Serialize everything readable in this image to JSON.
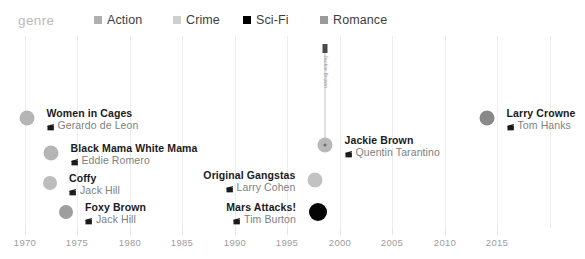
{
  "legend": {
    "title": "genre",
    "items": [
      {
        "label": "Action",
        "color": "#b0b0b0",
        "x": 94
      },
      {
        "label": "Crime",
        "color": "#cfcfcf",
        "x": 173
      },
      {
        "label": "Sci-Fi",
        "color": "#000000",
        "x": 243
      },
      {
        "label": "Romance",
        "color": "#9a9a9a",
        "x": 320
      }
    ]
  },
  "icons": {
    "film": "film-clapper-icon"
  },
  "chart_data": {
    "type": "scatter",
    "title": "",
    "xlabel": "",
    "ylabel": "",
    "xlim": [
      1968.5,
      2017.5
    ],
    "grid": true,
    "legend_position": "top",
    "axis_ticks": [
      1970,
      1975,
      1980,
      1985,
      1990,
      1995,
      2000,
      2005,
      2010,
      2015
    ],
    "categories": [
      "Action",
      "Crime",
      "Sci-Fi",
      "Romance"
    ],
    "points": [
      {
        "title": "Women in Cages",
        "director": "Gerardo de Leon",
        "year": 1971,
        "genre": "Action",
        "color": "#b5b5b5",
        "size": 15,
        "px": 27,
        "py": 82,
        "label_side": "left",
        "label_dx": 12,
        "label_dy": -11
      },
      {
        "title": "Black Mama White Mama",
        "director": "Eddie Romero",
        "year": 1973,
        "genre": "Action",
        "color": "#b5b5b5",
        "size": 15,
        "px": 51,
        "py": 117,
        "label_side": "left",
        "label_dx": 12,
        "label_dy": -11
      },
      {
        "title": "Coffy",
        "director": "Jack Hill",
        "year": 1973,
        "genre": "Action",
        "color": "#bdbdbd",
        "size": 14,
        "px": 50,
        "py": 147,
        "label_side": "left",
        "label_dx": 12,
        "label_dy": -11
      },
      {
        "title": "Foxy Brown",
        "director": "Jack Hill",
        "year": 1974,
        "genre": "Action",
        "color": "#9e9e9e",
        "size": 14,
        "px": 66,
        "py": 176,
        "label_side": "left",
        "label_dx": 12,
        "label_dy": -11
      },
      {
        "title": "Original Gangstas",
        "director": "Larry Cohen",
        "year": 1996,
        "genre": "Crime",
        "color": "#c2c2c2",
        "size": 15,
        "px": 315,
        "py": 144,
        "label_side": "right",
        "label_dx": -12,
        "label_dy": -11
      },
      {
        "title": "Mars Attacks!",
        "director": "Tim Burton",
        "year": 1996,
        "genre": "Sci-Fi",
        "color": "#050505",
        "size": 18,
        "px": 318,
        "py": 176,
        "label_side": "right",
        "label_dx": -13,
        "label_dy": -11
      },
      {
        "title": "Jackie Brown",
        "director": "Quentin Tarantino",
        "year": 1997,
        "genre": "Crime",
        "color": "#b8b8b8",
        "size": 15,
        "px": 325,
        "py": 109,
        "label_side": "left",
        "label_dx": 12,
        "label_dy": -11,
        "has_inner_dot": true,
        "stem": {
          "label": "Jackie Brown",
          "top": 8,
          "height": 96,
          "cap_height": 9
        }
      },
      {
        "title": "Larry Crowne",
        "director": "Tom Hanks",
        "year": 2011,
        "genre": "Romance",
        "color": "#898989",
        "size": 15,
        "px": 487,
        "py": 82,
        "label_side": "left",
        "label_dx": 12,
        "label_dy": -11
      }
    ]
  },
  "gridlines_px": [
    25,
    77,
    130,
    182,
    235,
    287,
    340,
    392,
    445,
    497,
    550
  ],
  "axis_px": [
    {
      "label": "1970",
      "x": 25
    },
    {
      "label": "1975",
      "x": 77
    },
    {
      "label": "1980",
      "x": 130
    },
    {
      "label": "1985",
      "x": 182
    },
    {
      "label": "1990",
      "x": 235
    },
    {
      "label": "1995",
      "x": 287
    },
    {
      "label": "2000",
      "x": 340
    },
    {
      "label": "2005",
      "x": 392
    },
    {
      "label": "2010",
      "x": 445
    },
    {
      "label": "2015",
      "x": 497
    }
  ]
}
